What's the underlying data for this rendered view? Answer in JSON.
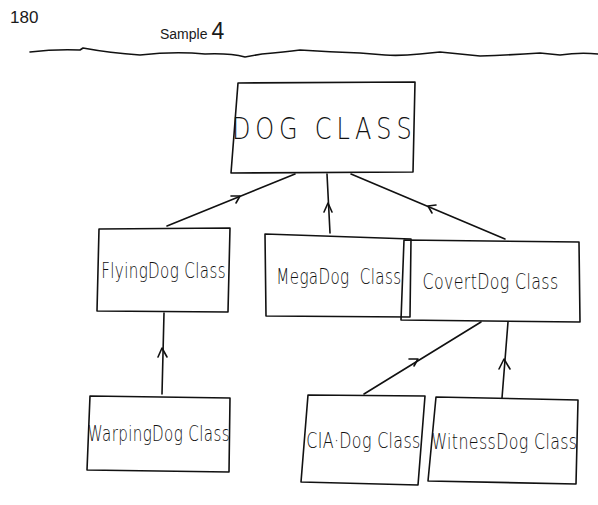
{
  "header": {
    "page_number": "180",
    "sample_label": "Sample",
    "sample_number": "4"
  },
  "diagram": {
    "type": "class-hierarchy",
    "nodes": [
      {
        "id": "dog",
        "label": "DOG CLASS",
        "level": 0
      },
      {
        "id": "flying",
        "label": "FlyingDog Class",
        "level": 1,
        "parent": "dog"
      },
      {
        "id": "mega",
        "label": "MegaDog  Class",
        "level": 1,
        "parent": "dog"
      },
      {
        "id": "covert",
        "label": "CovertDog Class",
        "level": 1,
        "parent": "dog"
      },
      {
        "id": "warping",
        "label": "WarpingDog Class",
        "level": 2,
        "parent": "flying"
      },
      {
        "id": "cia",
        "label": "CIA·Dog Class",
        "level": 2,
        "parent": "covert"
      },
      {
        "id": "witness",
        "label": "WitnessDog Class",
        "level": 2,
        "parent": "covert"
      }
    ],
    "edges": [
      {
        "from": "flying",
        "to": "dog"
      },
      {
        "from": "mega",
        "to": "dog"
      },
      {
        "from": "covert",
        "to": "dog"
      },
      {
        "from": "warping",
        "to": "flying"
      },
      {
        "from": "cia",
        "to": "covert"
      },
      {
        "from": "witness",
        "to": "covert"
      }
    ],
    "ink_color": "#111111",
    "paper_color": "#ffffff"
  }
}
